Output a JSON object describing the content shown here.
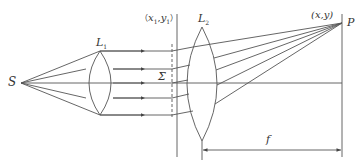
{
  "diagram": {
    "type": "optics-fraunhofer-setup",
    "labels": {
      "source": "S",
      "lens1": "L",
      "lens1_sub": "1",
      "lens2": "L",
      "lens2_sub": "2",
      "aperture_plane": "Σ",
      "aperture_coord_open": "（",
      "aperture_coord_x": "x",
      "aperture_coord_x_sub": "1",
      "aperture_coord_sep": ",",
      "aperture_coord_y": "y",
      "aperture_coord_y_sub": "1",
      "aperture_coord_close": "）",
      "screen_coord": "(x,y)",
      "point": "P",
      "focal_length": "f"
    },
    "colors": {
      "line": "#555555",
      "text": "#333333",
      "background": "#ffffff"
    }
  }
}
